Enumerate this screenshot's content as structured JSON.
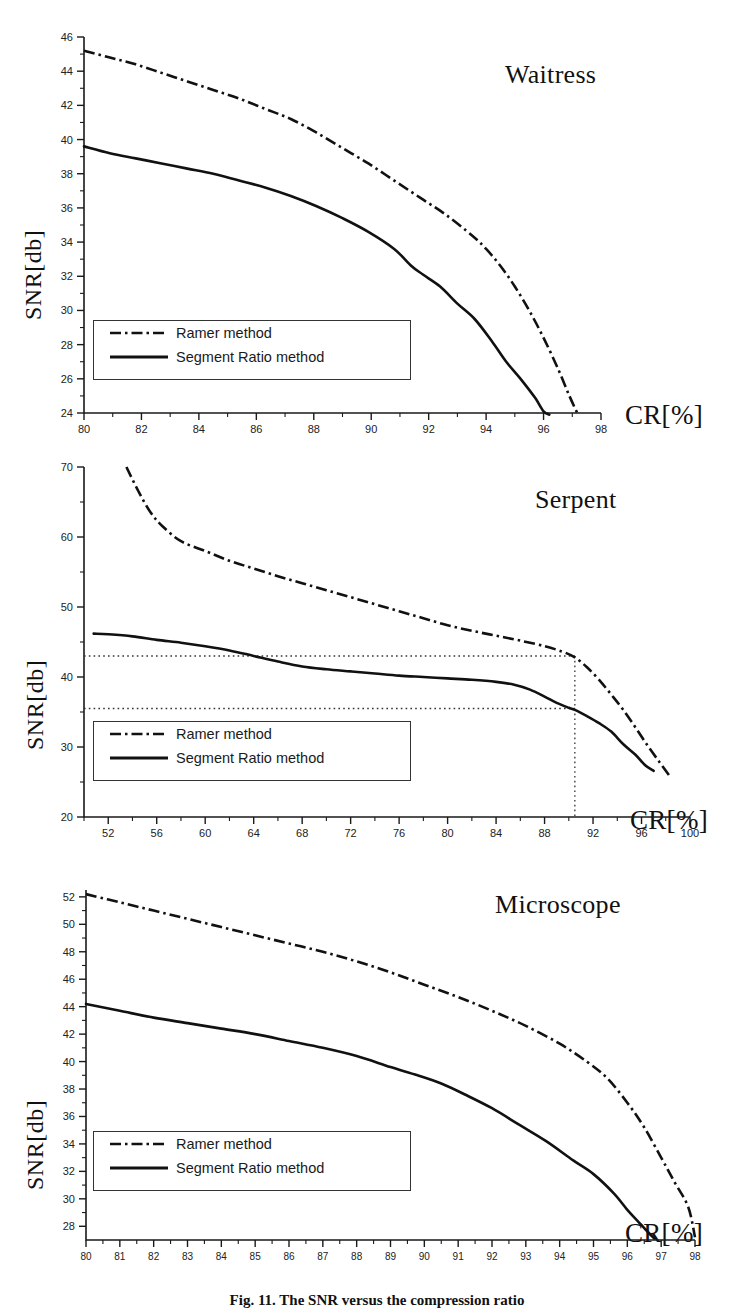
{
  "figure": {
    "caption": "Fig. 11.  The SNR  versus  the  compression  ratio",
    "axis_label_y": "SNR[db]",
    "axis_label_x": "CR[%]"
  },
  "legend": {
    "ramer_label": "Ramer method",
    "segment_label": "Segment Ratio method",
    "ramer_style": "dash-dot",
    "segment_style": "solid",
    "color": "#111111"
  },
  "chart_data": [
    {
      "type": "line",
      "title": "Waitress",
      "xlabel": "CR[%]",
      "ylabel": "SNR[db]",
      "xlim": [
        80,
        98
      ],
      "ylim": [
        24,
        46
      ],
      "xticks": [
        80,
        82,
        84,
        86,
        88,
        90,
        92,
        94,
        96,
        98
      ],
      "xtick_step": 2,
      "yticks": [
        24,
        26,
        28,
        30,
        32,
        34,
        36,
        38,
        40,
        42,
        44,
        46
      ],
      "ytick_step": 2,
      "grid": false,
      "legend_position": "lower-left",
      "series": [
        {
          "name": "Ramer method",
          "style": "dash-dot",
          "x": [
            80.0,
            80.9,
            81.8,
            82.7,
            83.6,
            84.5,
            85.4,
            86.3,
            87.2,
            88.1,
            89.0,
            89.9,
            90.8,
            91.7,
            92.6,
            93.5,
            94.0,
            94.5,
            95.0,
            95.5,
            96.0,
            96.5,
            96.9,
            97.2
          ],
          "y": [
            45.2,
            44.8,
            44.4,
            43.9,
            43.4,
            42.9,
            42.4,
            41.8,
            41.2,
            40.4,
            39.5,
            38.6,
            37.6,
            36.6,
            35.6,
            34.4,
            33.6,
            32.6,
            31.4,
            30.0,
            28.4,
            26.6,
            25.0,
            23.9
          ]
        },
        {
          "name": "Segment Ratio method",
          "style": "solid",
          "x": [
            80.0,
            80.9,
            81.8,
            82.7,
            83.6,
            84.5,
            85.4,
            86.3,
            87.2,
            88.1,
            89.0,
            89.9,
            90.8,
            91.4,
            91.8,
            92.4,
            93.0,
            93.6,
            94.2,
            94.7,
            95.2,
            95.7,
            96.0,
            96.2
          ],
          "y": [
            39.6,
            39.2,
            38.9,
            38.6,
            38.3,
            38.0,
            37.6,
            37.2,
            36.7,
            36.1,
            35.4,
            34.6,
            33.6,
            32.6,
            32.1,
            31.4,
            30.4,
            29.5,
            28.2,
            27.0,
            26.0,
            24.9,
            24.1,
            23.9
          ]
        }
      ]
    },
    {
      "type": "line",
      "title": "Serpent",
      "xlabel": "CR[%]",
      "ylabel": "SNR[db]",
      "xlim": [
        50,
        100
      ],
      "ylim": [
        20,
        70
      ],
      "xticks": [
        52,
        56,
        60,
        64,
        68,
        72,
        76,
        80,
        84,
        88,
        92,
        96,
        100
      ],
      "xtick_step": 4,
      "yticks": [
        20,
        30,
        40,
        50,
        60,
        70
      ],
      "ytick_step": 10,
      "grid": false,
      "legend_position": "lower-left",
      "reference_lines": {
        "horizontal": [
          43.0,
          35.5
        ],
        "vertical": [
          90.5
        ]
      },
      "series": [
        {
          "name": "Ramer method",
          "style": "dash-dot",
          "x": [
            53.5,
            54.5,
            55.5,
            56.5,
            58.0,
            60.0,
            62.0,
            64.0,
            66.0,
            68.0,
            70.0,
            72.0,
            74.0,
            76.0,
            78.0,
            80.0,
            82.0,
            84.0,
            86.0,
            88.0,
            89.5,
            90.5,
            91.5,
            92.5,
            93.5,
            94.5,
            95.5,
            96.5,
            97.5,
            98.3
          ],
          "y": [
            70.0,
            66.5,
            63.5,
            61.5,
            59.4,
            58.0,
            56.6,
            55.5,
            54.4,
            53.4,
            52.4,
            51.4,
            50.4,
            49.4,
            48.4,
            47.4,
            46.6,
            45.9,
            45.2,
            44.4,
            43.6,
            42.8,
            41.4,
            39.6,
            37.5,
            35.3,
            32.8,
            30.2,
            27.8,
            25.9
          ]
        },
        {
          "name": "Segment Ratio method",
          "style": "solid",
          "x": [
            50.8,
            52.0,
            54.0,
            56.0,
            58.0,
            60.0,
            62.0,
            64.0,
            66.0,
            68.0,
            70.0,
            72.0,
            74.0,
            76.0,
            78.0,
            80.0,
            82.0,
            84.0,
            85.5,
            86.8,
            88.0,
            89.0,
            90.0,
            90.5,
            91.5,
            92.5,
            93.5,
            94.5,
            95.5,
            96.3,
            97.0
          ],
          "y": [
            46.2,
            46.1,
            45.8,
            45.3,
            44.9,
            44.4,
            43.8,
            43.0,
            42.2,
            41.5,
            41.1,
            40.8,
            40.5,
            40.2,
            40.0,
            39.8,
            39.6,
            39.3,
            38.9,
            38.2,
            37.2,
            36.3,
            35.6,
            35.3,
            34.4,
            33.4,
            32.2,
            30.4,
            28.9,
            27.4,
            26.6
          ]
        }
      ]
    },
    {
      "type": "line",
      "title": "Microscope",
      "xlabel": "CR[%]",
      "ylabel": "SNR[db]",
      "xlim": [
        80,
        98
      ],
      "ylim": [
        27,
        52.5
      ],
      "xticks": [
        80,
        81,
        82,
        83,
        84,
        85,
        86,
        87,
        88,
        89,
        90,
        91,
        92,
        93,
        94,
        95,
        96,
        97,
        98
      ],
      "xtick_step": 1,
      "yticks": [
        28,
        30,
        32,
        34,
        36,
        38,
        40,
        42,
        44,
        46,
        48,
        50,
        52
      ],
      "ytick_step": 2,
      "grid": false,
      "legend_position": "lower-left",
      "series": [
        {
          "name": "Ramer method",
          "style": "dash-dot",
          "x": [
            80.0,
            81.0,
            82.0,
            83.0,
            84.0,
            85.0,
            86.0,
            87.0,
            88.0,
            89.0,
            90.0,
            91.0,
            92.0,
            93.0,
            94.0,
            94.8,
            95.4,
            96.0,
            96.5,
            97.0,
            97.4,
            97.8,
            98.0
          ],
          "y": [
            52.2,
            51.6,
            51.0,
            50.4,
            49.8,
            49.2,
            48.6,
            48.0,
            47.3,
            46.5,
            45.6,
            44.7,
            43.7,
            42.6,
            41.3,
            40.0,
            38.8,
            37.0,
            35.2,
            33.0,
            31.2,
            29.4,
            27.2
          ]
        },
        {
          "name": "Segment Ratio method",
          "style": "solid",
          "x": [
            80.0,
            81.0,
            82.0,
            83.0,
            84.0,
            85.0,
            86.0,
            87.0,
            88.0,
            89.0,
            89.8,
            90.5,
            91.2,
            92.0,
            92.8,
            93.6,
            94.4,
            95.0,
            95.6,
            96.0,
            96.3,
            96.6,
            96.8
          ],
          "y": [
            44.2,
            43.7,
            43.2,
            42.8,
            42.4,
            42.0,
            41.5,
            41.0,
            40.4,
            39.6,
            39.0,
            38.4,
            37.6,
            36.6,
            35.4,
            34.2,
            32.8,
            31.8,
            30.4,
            29.2,
            28.4,
            27.6,
            27.1
          ]
        }
      ]
    }
  ]
}
